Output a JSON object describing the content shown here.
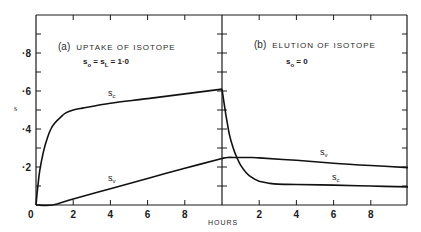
{
  "chart_data": [
    {
      "type": "line",
      "panel": "a",
      "title": "(a) UPTAKE OF ISOTOPE",
      "annotation": "s_o = s_L = 1·0",
      "xlabel": "HOURS",
      "ylabel": "s",
      "xlim": [
        0,
        10
      ],
      "ylim": [
        0,
        1.0
      ],
      "xticks": [
        0,
        2,
        4,
        6,
        8
      ],
      "yticks": [
        0.2,
        0.4,
        0.6,
        0.8
      ],
      "ytick_labels": [
        "·2",
        "·4",
        "·6",
        "·8"
      ],
      "grid": false,
      "series": [
        {
          "name": "s_c",
          "x": [
            0,
            0.1,
            0.2,
            0.4,
            0.6,
            0.8,
            1.0,
            1.3,
            1.6,
            2.0,
            2.5,
            4,
            6,
            8,
            10
          ],
          "y": [
            0,
            0.1,
            0.18,
            0.28,
            0.35,
            0.4,
            0.43,
            0.46,
            0.485,
            0.5,
            0.51,
            0.535,
            0.56,
            0.585,
            0.61
          ]
        },
        {
          "name": "s_v",
          "x": [
            0,
            0.9,
            2,
            4,
            6,
            8,
            10
          ],
          "y": [
            0,
            0,
            0.032,
            0.086,
            0.14,
            0.193,
            0.245
          ]
        }
      ]
    },
    {
      "type": "line",
      "panel": "b",
      "title": "(b) ELUTION OF ISOTOPE",
      "annotation": "s_o = 0",
      "xlabel": "HOURS",
      "ylabel": "s",
      "xlim": [
        0,
        10
      ],
      "ylim": [
        0,
        1.0
      ],
      "xticks": [
        2,
        4,
        6,
        8
      ],
      "yticks": [
        0.2,
        0.4,
        0.6,
        0.8
      ],
      "grid": false,
      "series": [
        {
          "name": "s_c",
          "x": [
            0,
            0.2,
            0.4,
            0.6,
            0.8,
            1.0,
            1.3,
            1.6,
            2.0,
            2.5,
            3.0,
            4,
            6,
            8,
            10
          ],
          "y": [
            0.61,
            0.48,
            0.37,
            0.3,
            0.25,
            0.21,
            0.17,
            0.145,
            0.125,
            0.115,
            0.11,
            0.108,
            0.105,
            0.1,
            0.095
          ]
        },
        {
          "name": "s_v",
          "x": [
            0,
            0.3,
            0.8,
            1.5,
            2,
            4,
            6,
            8,
            10
          ],
          "y": [
            0.245,
            0.25,
            0.25,
            0.25,
            0.248,
            0.235,
            0.22,
            0.208,
            0.197
          ]
        }
      ]
    }
  ],
  "labels": {
    "panel_a_title_paren": "(a)",
    "panel_a_title_text": "UPTAKE OF ISOTOPE",
    "panel_b_title_paren": "(b)",
    "panel_b_title_text": "ELUTION OF ISOTOPE",
    "annotation_a_s": "s",
    "annotation_a_o": "o",
    "annotation_a_eq1": " = s",
    "annotation_a_L": "L",
    "annotation_a_eq2": " = 1·0",
    "annotation_b_s": "s",
    "annotation_b_o": "o",
    "annotation_b_eq": " = 0",
    "y_axis": "s",
    "x_axis": "HOURS",
    "origin": "0",
    "sc_s": "s",
    "sc_sub": "c",
    "sv_s": "s",
    "sv_sub": "v"
  }
}
